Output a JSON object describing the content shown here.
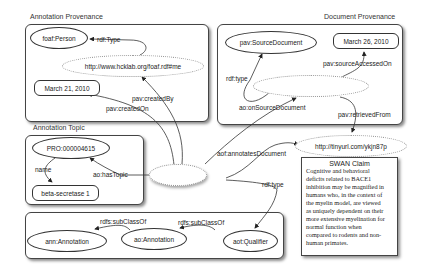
{
  "groups": {
    "annotation_provenance": {
      "label": "Annotation Provenance"
    },
    "document_provenance": {
      "label": "Document Provenance"
    },
    "annotation_topic": {
      "label": "Annotation Topic"
    }
  },
  "nodes": {
    "foaf_person": "foaf:Person",
    "hcklab_uri": "http://www.hcklab.org/foaf.rdf#me",
    "created_date": "March 21, 2010",
    "pav_source_document": "pav:SourceDocument",
    "accessed_date": "March 26, 2010",
    "pro_id": "PRO:000004615",
    "beta_secretase": "beta-secretase 1",
    "tinyurl": "http://tinyurl.com/ykjn87p",
    "ann_annotation": "ann:Annotation",
    "ao_annotation": "ao:Annotation",
    "aot_qualifier": "aot:Qualifier"
  },
  "edges": {
    "rdf_type_person": "rdf:Type",
    "pav_created_by": "pav:createdBy",
    "pav_created_on": "pav:createdOn",
    "rdf_type_source": "rdf:type",
    "pav_source_accessed_on": "pav:sourceAccessedOn",
    "ao_on_source_document": "ao:onSourceDocument",
    "pav_retrieved_from": "pav:retrievedFrom",
    "aof_annotates_document": "aof:annotatesDocument",
    "name": "name",
    "ao_has_topic": "ao:hasTopic",
    "rdf_type_qualifier": "rdf:type",
    "rdfs_subclassof_1": "rdfs:subClassOf",
    "rdfs_subclassof_2": "rdfs:subClassOf"
  },
  "claim": {
    "title": "SWAN Claim",
    "lines": [
      "Cognitive and behavioral",
      "deficits related to BACE1",
      "inhibition may be magnified in",
      "humans who, in the context of",
      "the myelin model, are viewed",
      "as uniquely dependent on their",
      "more extensive myelination for",
      "normal function when",
      "compared to rodents and non-",
      "human primates."
    ]
  }
}
